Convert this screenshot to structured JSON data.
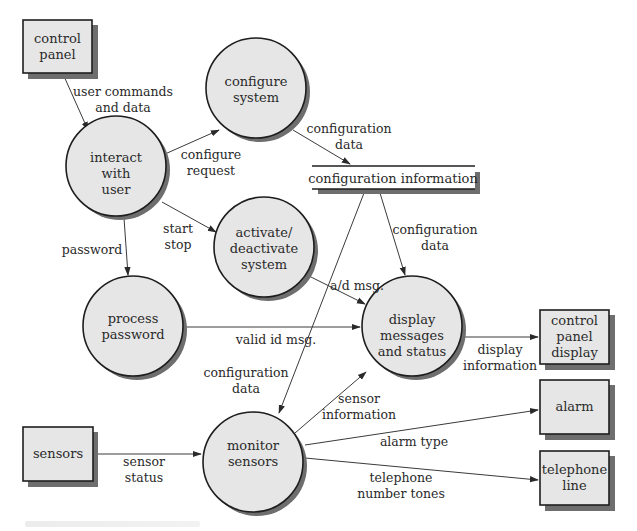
{
  "diagram": {
    "type": "data-flow-diagram",
    "colors": {
      "fill": "#e6e6e6",
      "stroke": "#1e1e1e",
      "shadow": "#6e6e6e",
      "text": "#2a2a2a",
      "line": "#3a3a3a"
    },
    "entities": [
      {
        "id": "control_panel",
        "lines": [
          "control",
          "panel"
        ]
      },
      {
        "id": "sensors",
        "lines": [
          "sensors"
        ]
      },
      {
        "id": "control_panel_display",
        "lines": [
          "control",
          "panel",
          "display"
        ]
      },
      {
        "id": "alarm",
        "lines": [
          "alarm"
        ]
      },
      {
        "id": "telephone_line",
        "lines": [
          "telephone",
          "line"
        ]
      }
    ],
    "processes": [
      {
        "id": "interact_with_user",
        "lines": [
          "interact",
          "with",
          "user"
        ]
      },
      {
        "id": "configure_system",
        "lines": [
          "configure",
          "system"
        ]
      },
      {
        "id": "activate_deactivate_system",
        "lines": [
          "activate/",
          "deactivate",
          "system"
        ]
      },
      {
        "id": "process_password",
        "lines": [
          "process",
          "password"
        ]
      },
      {
        "id": "display_messages_and_status",
        "lines": [
          "display",
          "messages",
          "and status"
        ]
      },
      {
        "id": "monitor_sensors",
        "lines": [
          "monitor",
          "sensors"
        ]
      }
    ],
    "data_store": {
      "id": "configuration_information",
      "label": "configuration information"
    },
    "flows": [
      {
        "from": "control_panel",
        "to": "interact_with_user",
        "lines": [
          "user commands",
          "and data"
        ]
      },
      {
        "from": "interact_with_user",
        "to": "configure_system",
        "lines": [
          "configure",
          "request"
        ]
      },
      {
        "from": "configure_system",
        "to": "configuration_information",
        "lines": [
          "configuration",
          "data"
        ]
      },
      {
        "from": "interact_with_user",
        "to": "activate_deactivate_system",
        "lines": [
          "start",
          "stop"
        ]
      },
      {
        "from": "interact_with_user",
        "to": "process_password",
        "lines": [
          "password"
        ]
      },
      {
        "from": "configuration_information",
        "to": "display_messages_and_status",
        "lines": [
          "configuration",
          "data"
        ]
      },
      {
        "from": "activate_deactivate_system",
        "to": "display_messages_and_status",
        "lines": [
          "a/d msg."
        ]
      },
      {
        "from": "process_password",
        "to": "display_messages_and_status",
        "lines": [
          "valid id msg."
        ]
      },
      {
        "from": "configuration_information",
        "to": "monitor_sensors",
        "lines": [
          "configuration",
          "data"
        ]
      },
      {
        "from": "display_messages_and_status",
        "to": "control_panel_display",
        "lines": [
          "display",
          "information"
        ]
      },
      {
        "from": "monitor_sensors",
        "to": "display_messages_and_status",
        "lines": [
          "sensor",
          "information"
        ]
      },
      {
        "from": "sensors",
        "to": "monitor_sensors",
        "lines": [
          "sensor",
          "status"
        ]
      },
      {
        "from": "monitor_sensors",
        "to": "alarm",
        "lines": [
          "alarm type"
        ]
      },
      {
        "from": "monitor_sensors",
        "to": "telephone_line",
        "lines": [
          "telephone",
          "number tones"
        ]
      }
    ]
  }
}
